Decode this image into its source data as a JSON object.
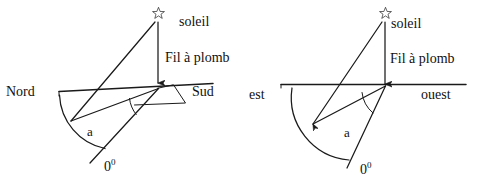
{
  "figure": {
    "ink_color": "#1a1a1a",
    "background_color": "#ffffff"
  },
  "diagrams": [
    {
      "id": "left",
      "name": "nord-sud-diagram",
      "star_label": "soleil",
      "plumb_label": "Fil à plomb",
      "left_direction": "Nord",
      "right_direction": "Sud",
      "angle_label": "a",
      "zero_value": "0",
      "zero_superscript": "0",
      "star_icon": "star-icon",
      "arrow_icon": "down-arrow-icon",
      "has_shadow_parallelogram": true
    },
    {
      "id": "right",
      "name": "est-ouest-diagram",
      "star_label": "soleil",
      "plumb_label": "Fil à plomb",
      "left_direction": "est",
      "right_direction": "ouest",
      "angle_label": "a",
      "zero_value": "0",
      "zero_superscript": "0",
      "star_icon": "star-icon",
      "arrow_icon": "down-arrow-icon",
      "has_shadow_parallelogram": false
    }
  ]
}
